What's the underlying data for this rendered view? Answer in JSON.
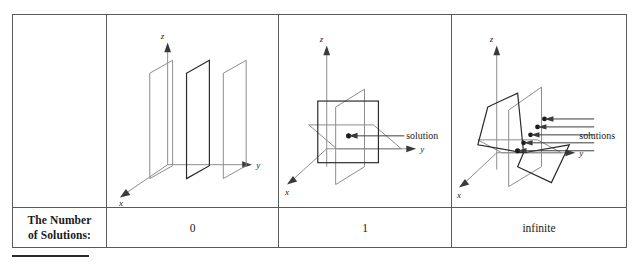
{
  "table": {
    "row_label": "The Number\nof Solutions:",
    "row_label_line1": "The Number",
    "row_label_line2": "of Solutions:",
    "columns": [
      {
        "key": "none",
        "count": "0",
        "diagram": "three-parallel-planes"
      },
      {
        "key": "one",
        "count": "1",
        "diagram": "three-planes-point-intersection"
      },
      {
        "key": "infinite",
        "count": "infinite",
        "diagram": "three-planes-line-intersection"
      }
    ]
  },
  "diagrams": {
    "parallel_planes": {
      "axis_x": "x",
      "axis_y": "y",
      "axis_z": "z",
      "plane_count": 3
    },
    "point_solution": {
      "axis_x": "x",
      "axis_y": "y",
      "axis_z": "z",
      "callout": "solution",
      "solution_points": 1
    },
    "line_solutions": {
      "axis_x": "x",
      "axis_y": "y",
      "axis_z": "z",
      "callout": "solutions",
      "solution_points": 5
    }
  },
  "colors": {
    "border": "#5a5a5a",
    "plane_light": "#8c8c8c",
    "plane_dark": "#2b2b2b",
    "ink": "#1a1a1a",
    "page_background": "#ffffff"
  }
}
